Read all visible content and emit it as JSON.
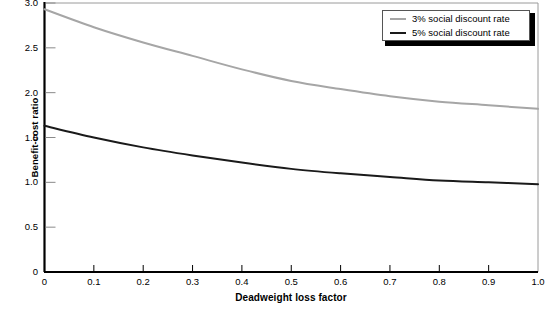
{
  "chart_data": {
    "type": "line",
    "title": "",
    "xlabel": "Deadweight loss factor",
    "ylabel": "Benefit-cost ratio",
    "xlim": [
      0,
      1.0
    ],
    "ylim": [
      0,
      3.0
    ],
    "grid": false,
    "legend_position": "top-right",
    "xticks": [
      "0",
      "0.1",
      "0.2",
      "0.3",
      "0.4",
      "0.5",
      "0.6",
      "0.7",
      "0.8",
      "0.9",
      "1.0"
    ],
    "xtick_values": [
      0,
      0.1,
      0.2,
      0.3,
      0.4,
      0.5,
      0.6,
      0.7,
      0.8,
      0.9,
      1.0
    ],
    "yticks": [
      "0",
      "0.5",
      "1.0",
      "1.5",
      "2.0",
      "2.5",
      "3.0"
    ],
    "ytick_values": [
      0,
      0.5,
      1.0,
      1.5,
      2.0,
      2.5,
      3.0
    ],
    "x": [
      0,
      0.1,
      0.2,
      0.3,
      0.4,
      0.5,
      0.6,
      0.7,
      0.8,
      0.9,
      1.0
    ],
    "series": [
      {
        "name": "3% social discount rate",
        "color": "#a6a6a6",
        "values": [
          2.93,
          2.73,
          2.56,
          2.41,
          2.26,
          2.13,
          2.04,
          1.96,
          1.9,
          1.86,
          1.82
        ]
      },
      {
        "name": "5% social discount rate",
        "color": "#1a1a1a",
        "values": [
          1.63,
          1.5,
          1.39,
          1.3,
          1.22,
          1.15,
          1.1,
          1.06,
          1.02,
          1.0,
          0.98
        ]
      }
    ]
  },
  "legend": {
    "entries": [
      {
        "label": "3% social discount rate"
      },
      {
        "label": "5% social discount rate"
      }
    ]
  },
  "axes": {
    "x_title": "Deadweight loss factor",
    "y_title": "Benefit-cost ratio"
  }
}
